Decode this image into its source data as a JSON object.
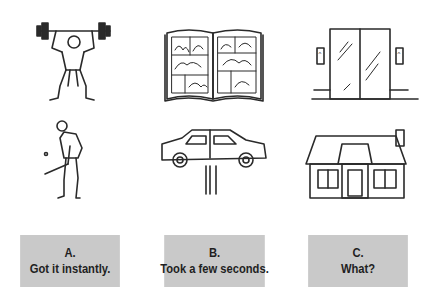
{
  "illustrations": [
    {
      "id": "weightlifter",
      "label": "weightlifter-illustration",
      "row": 1,
      "col": 1
    },
    {
      "id": "comic-book",
      "label": "comic-book-illustration",
      "row": 1,
      "col": 2
    },
    {
      "id": "elevator",
      "label": "elevator-illustration",
      "row": 1,
      "col": 3
    },
    {
      "id": "golfer",
      "label": "golfer-illustration",
      "row": 2,
      "col": 1
    },
    {
      "id": "car-on-lift",
      "label": "car-on-lift-illustration",
      "row": 2,
      "col": 2
    },
    {
      "id": "house",
      "label": "house-illustration",
      "row": 2,
      "col": 3
    }
  ],
  "options": [
    {
      "letter": "A.",
      "text": "Got it instantly."
    },
    {
      "letter": "B.",
      "text": "Took a few seconds."
    },
    {
      "letter": "C.",
      "text": "What?"
    }
  ],
  "colors": {
    "box_fill": "#c9c9c9",
    "text": "#1f1f1f",
    "ink": "#2a2a2a",
    "background": "#ffffff"
  }
}
